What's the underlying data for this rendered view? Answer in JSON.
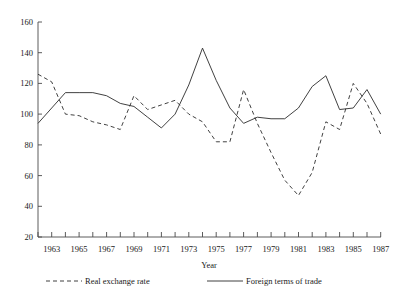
{
  "chart_data": {
    "type": "line",
    "title": "",
    "xlabel": "Year",
    "ylabel": "",
    "xlim": [
      1962,
      1987
    ],
    "ylim": [
      20,
      160
    ],
    "grid": false,
    "legend_position": "bottom",
    "x": [
      1962,
      1963,
      1964,
      1965,
      1966,
      1967,
      1968,
      1969,
      1970,
      1971,
      1972,
      1973,
      1974,
      1975,
      1976,
      1977,
      1978,
      1979,
      1980,
      1981,
      1982,
      1983,
      1984,
      1985,
      1986,
      1987
    ],
    "y_ticks": [
      20,
      40,
      60,
      80,
      100,
      120,
      140,
      160
    ],
    "x_ticks": [
      1963,
      1965,
      1967,
      1969,
      1971,
      1973,
      1975,
      1977,
      1979,
      1981,
      1983,
      1985,
      1987
    ],
    "series": [
      {
        "name": "Real exchange rate",
        "style": "dashed",
        "color": "#2b2b2b",
        "values": [
          126,
          121,
          100,
          99,
          95,
          93,
          90,
          112,
          103,
          106,
          109,
          100,
          95,
          82,
          82,
          116,
          94,
          75,
          57,
          47,
          62,
          95,
          90,
          120,
          107,
          87
        ]
      },
      {
        "name": "Foreign terms of trade",
        "style": "solid",
        "color": "#2b2b2b",
        "values": [
          94,
          104,
          114,
          114,
          114,
          112,
          107,
          105,
          98,
          91,
          100,
          119,
          143,
          122,
          104,
          94,
          98,
          97,
          97,
          104,
          118,
          125,
          103,
          104,
          116,
          100
        ]
      }
    ],
    "legend": [
      {
        "label": "Real exchange rate",
        "style": "dashed"
      },
      {
        "label": "Foreign terms of trade",
        "style": "solid"
      }
    ]
  },
  "axis": {
    "x_title": "Year",
    "y_tick_labels": [
      "160",
      "140",
      "120",
      "100",
      "80",
      "60",
      "40",
      "20"
    ],
    "x_tick_labels": [
      "1963",
      "1965",
      "1967",
      "1969",
      "1971",
      "1973",
      "1975",
      "1977",
      "1979",
      "1981",
      "1983",
      "1985",
      "1987"
    ]
  },
  "legend": {
    "item_1_label": "Real exchange rate",
    "item_2_label": "Foreign terms of trade"
  }
}
